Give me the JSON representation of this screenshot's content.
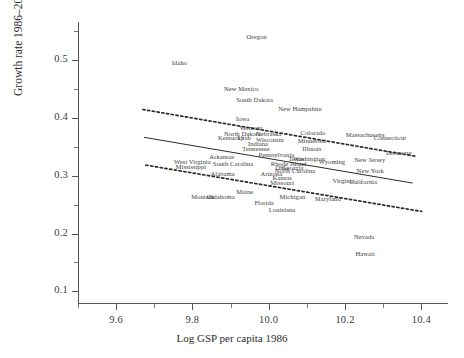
{
  "chart_data": {
    "type": "scatter",
    "title": "",
    "xlabel": "Log GSP per capita 1986",
    "ylabel": "Growth rate 1986–2001",
    "xlim": [
      9.5,
      10.47
    ],
    "ylim": [
      0.08,
      0.565
    ],
    "xticks": [
      9.6,
      9.8,
      10.0,
      10.2,
      10.4
    ],
    "xticklabels": [
      "9.6",
      "9.8",
      "10.0",
      "10.2",
      "10.4"
    ],
    "yticks": [
      0.1,
      0.2,
      0.3,
      0.4,
      0.5
    ],
    "yticklabels": [
      "0.1",
      "0.2",
      "0.3",
      "0.4",
      "0.5"
    ],
    "minor_xticks": [
      9.5,
      9.7,
      9.9,
      10.1,
      10.3
    ],
    "minor_yticks": [
      0.15,
      0.25,
      0.35,
      0.45,
      0.55
    ],
    "grid": false,
    "legend": "none",
    "point_marker": "text-label",
    "points": [
      {
        "label": "Oregon",
        "x": 9.968,
        "y": 0.541
      },
      {
        "label": "Idaho",
        "x": 9.766,
        "y": 0.496
      },
      {
        "label": "New Mexico",
        "x": 9.928,
        "y": 0.452
      },
      {
        "label": "South Dakota",
        "x": 9.963,
        "y": 0.433
      },
      {
        "label": "New Hampshire",
        "x": 10.082,
        "y": 0.417
      },
      {
        "label": "Iowa",
        "x": 9.932,
        "y": 0.399
      },
      {
        "label": "Vermont",
        "x": 9.953,
        "y": 0.384
      },
      {
        "label": "North Dakota",
        "x": 9.931,
        "y": 0.374
      },
      {
        "label": "Nebraska",
        "x": 10.0,
        "y": 0.373
      },
      {
        "label": "Colorado",
        "x": 10.116,
        "y": 0.376
      },
      {
        "label": "Massachusetts",
        "x": 10.253,
        "y": 0.372
      },
      {
        "label": "Connecticut",
        "x": 10.318,
        "y": 0.366
      },
      {
        "label": "Kentucky",
        "x": 9.901,
        "y": 0.366
      },
      {
        "label": "Utah",
        "x": 9.936,
        "y": 0.366
      },
      {
        "label": "Wisconsin",
        "x": 10.003,
        "y": 0.363
      },
      {
        "label": "Minnesota",
        "x": 10.113,
        "y": 0.362
      },
      {
        "label": "Indiana",
        "x": 9.972,
        "y": 0.356
      },
      {
        "label": "Tennessee",
        "x": 9.967,
        "y": 0.347
      },
      {
        "label": "Illinois",
        "x": 10.113,
        "y": 0.348
      },
      {
        "label": "Delaware",
        "x": 10.341,
        "y": 0.34
      },
      {
        "label": "Arkansas",
        "x": 9.877,
        "y": 0.333
      },
      {
        "label": "Pennsylvania",
        "x": 10.02,
        "y": 0.338
      },
      {
        "label": "Texas",
        "x": 10.072,
        "y": 0.33
      },
      {
        "label": "Washington",
        "x": 10.106,
        "y": 0.33
      },
      {
        "label": "New Jersey",
        "x": 10.265,
        "y": 0.328
      },
      {
        "label": "West Virginia",
        "x": 9.8,
        "y": 0.325
      },
      {
        "label": "South Carolina",
        "x": 9.906,
        "y": 0.322
      },
      {
        "label": "Rhode Island",
        "x": 10.052,
        "y": 0.321
      },
      {
        "label": "Georgia",
        "x": 10.063,
        "y": 0.315
      },
      {
        "label": "Wyoming",
        "x": 10.166,
        "y": 0.325
      },
      {
        "label": "Mississippi",
        "x": 9.796,
        "y": 0.316
      },
      {
        "label": "Ohio",
        "x": 10.035,
        "y": 0.314
      },
      {
        "label": "North Carolina",
        "x": 10.069,
        "y": 0.309
      },
      {
        "label": "New York",
        "x": 10.266,
        "y": 0.31
      },
      {
        "label": "Alabama",
        "x": 9.879,
        "y": 0.305
      },
      {
        "label": "Arizona",
        "x": 10.007,
        "y": 0.304
      },
      {
        "label": "Kansas",
        "x": 10.035,
        "y": 0.298
      },
      {
        "label": "Virginia",
        "x": 10.196,
        "y": 0.292
      },
      {
        "label": "California",
        "x": 10.248,
        "y": 0.291
      },
      {
        "label": "Missouri",
        "x": 10.035,
        "y": 0.289
      },
      {
        "label": "Maine",
        "x": 9.937,
        "y": 0.274
      },
      {
        "label": "Montana",
        "x": 9.828,
        "y": 0.265
      },
      {
        "label": "Oklahoma",
        "x": 9.874,
        "y": 0.265
      },
      {
        "label": "Michigan",
        "x": 10.062,
        "y": 0.264
      },
      {
        "label": "Maryland",
        "x": 10.155,
        "y": 0.261
      },
      {
        "label": "Florida",
        "x": 9.988,
        "y": 0.255
      },
      {
        "label": "Louisiana",
        "x": 10.035,
        "y": 0.243
      },
      {
        "label": "Nevada",
        "x": 10.25,
        "y": 0.196
      },
      {
        "label": "Hawaii",
        "x": 10.253,
        "y": 0.167
      }
    ],
    "fit_lines": [
      {
        "name": "regression-fit",
        "style": "solid",
        "x0": 9.673,
        "y0": 0.366,
        "x1": 10.377,
        "y1": 0.287
      },
      {
        "name": "upper-confidence-band",
        "style": "dotted",
        "x0": 9.67,
        "y0": 0.414,
        "x1": 10.387,
        "y1": 0.333
      },
      {
        "name": "lower-confidence-band",
        "style": "dotted",
        "x0": 9.678,
        "y0": 0.318,
        "x1": 10.401,
        "y1": 0.238
      }
    ]
  }
}
